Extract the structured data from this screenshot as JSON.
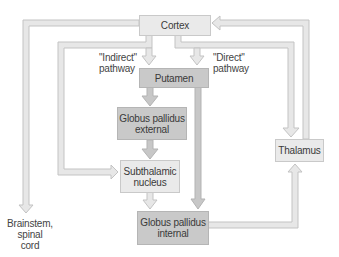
{
  "diagram": {
    "nodes": {
      "cortex": "Cortex",
      "putamen": "Putamen",
      "gpe_line1": "Globus pallidus",
      "gpe_line2": "external",
      "stn_line1": "Subthalamic",
      "stn_line2": "nucleus",
      "gpi_line1": "Globus pallidus",
      "gpi_line2": "internal",
      "thalamus": "Thalamus",
      "brainstem_line1": "Brainstem,",
      "brainstem_line2": "spinal cord"
    },
    "pathway_labels": {
      "indirect_line1": "\"Indirect\"",
      "indirect_line2": "pathway",
      "direct_line1": "\"Direct\"",
      "direct_line2": "pathway"
    },
    "connections": [
      {
        "from": "Cortex",
        "to": "Putamen",
        "via": "Indirect pathway"
      },
      {
        "from": "Cortex",
        "to": "Putamen",
        "via": "Direct pathway"
      },
      {
        "from": "Cortex",
        "to": "Brainstem, spinal cord"
      },
      {
        "from": "Cortex",
        "to": "Subthalamic nucleus"
      },
      {
        "from": "Cortex",
        "to": "Thalamus"
      },
      {
        "from": "Putamen",
        "to": "Globus pallidus external"
      },
      {
        "from": "Putamen",
        "to": "Globus pallidus internal"
      },
      {
        "from": "Globus pallidus external",
        "to": "Subthalamic nucleus"
      },
      {
        "from": "Subthalamic nucleus",
        "to": "Globus pallidus internal"
      },
      {
        "from": "Globus pallidus internal",
        "to": "Thalamus"
      },
      {
        "from": "Thalamus",
        "to": "Cortex"
      }
    ],
    "colors": {
      "light_box": "#eaeaea",
      "dark_box": "#c9c9c9",
      "arrow_fill": "#e6e6e6",
      "arrow_stroke": "#c4c4c4",
      "dark_arrow_fill": "#c6c6c6",
      "text": "#3a3a3a"
    }
  }
}
